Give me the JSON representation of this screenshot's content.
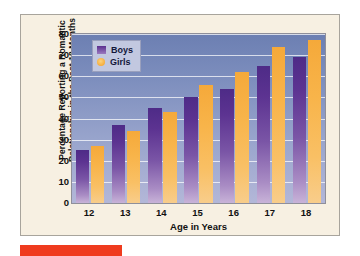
{
  "accent_bar": {
    "color": "#ef3b1e"
  },
  "panel": {
    "background": "#f7f0e2",
    "border": "#a8a49c"
  },
  "legend": {
    "position": "top-left-inside",
    "entries": [
      {
        "label": "Boys",
        "color": "#5b2f8e",
        "marker": "square-swatch"
      },
      {
        "label": "Girls",
        "color": "#f6ad3c",
        "marker": "circle-swatch"
      }
    ]
  },
  "chart_data": {
    "type": "bar",
    "title": "",
    "xlabel": "Age in Years",
    "ylabel": "Percentage Reporting a Romantic Relationship in the Past 18 Months",
    "categories": [
      "12",
      "13",
      "14",
      "15",
      "16",
      "17",
      "18"
    ],
    "series": [
      {
        "name": "Boys",
        "color": "#5b2f8e",
        "values": [
          25,
          37,
          45,
          50,
          54,
          65,
          69
        ]
      },
      {
        "name": "Girls",
        "color": "#f6ad3c",
        "values": [
          27,
          34,
          43,
          56,
          62,
          74,
          77
        ]
      }
    ],
    "ylim": [
      0,
      80
    ],
    "yticks": [
      0,
      10,
      20,
      30,
      40,
      50,
      60,
      70,
      80
    ],
    "ytick_labels": [
      "0",
      "10",
      "20",
      "30",
      "40",
      "50",
      "60",
      "70",
      "80"
    ],
    "xtick_labels": [
      "12",
      "13",
      "14",
      "15",
      "16",
      "17",
      "18"
    ],
    "grid": true,
    "grid_axis": "y",
    "legend_position": "upper left",
    "plot_background": "gradient slate-blue to lavender"
  }
}
